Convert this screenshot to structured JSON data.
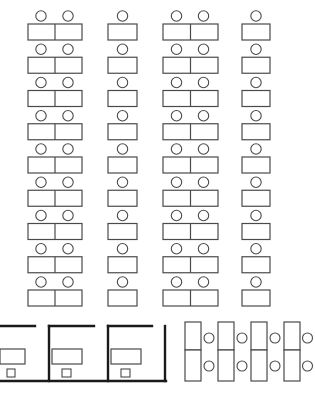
{
  "diagram": {
    "title": "",
    "type": "office-seating-layout",
    "colors": {
      "line": "#4a4a4a",
      "wall": "#1a1a1a",
      "background": "#ffffff"
    },
    "classroom_rows": {
      "row_count": 9,
      "first_desk_top": 24,
      "row_spacing": 33.25,
      "desk_height": 16,
      "seat_radius": 5.2,
      "seat_gap": 8,
      "columns": [
        {
          "name": "column-1",
          "x": 28,
          "width": 54,
          "seats": 2,
          "seat_centers": [
            41,
            68
          ]
        },
        {
          "name": "column-2",
          "x": 108,
          "width": 29,
          "seats": 1,
          "seat_centers": [
            122.5
          ]
        },
        {
          "name": "column-3",
          "x": 163,
          "width": 55,
          "seats": 2,
          "seat_centers": [
            176.5,
            203.5
          ]
        },
        {
          "name": "column-4",
          "x": 242,
          "width": 28,
          "seats": 1,
          "seat_centers": [
            256
          ]
        }
      ]
    },
    "cubicles": {
      "count": 3,
      "floor_y": 381,
      "top_y": 326,
      "units": [
        {
          "name": "cubicle-1",
          "left_wall_x": null,
          "top_wall": [
            0,
            35
          ],
          "desk": [
            0,
            349,
            25,
            15
          ],
          "chair": [
            7,
            369,
            8,
            8
          ]
        },
        {
          "name": "cubicle-2",
          "left_wall_x": 49,
          "top_wall": [
            49,
            94
          ],
          "desk": [
            52,
            349,
            30,
            15
          ],
          "chair": [
            62,
            369,
            9,
            8
          ]
        },
        {
          "name": "cubicle-3",
          "left_wall_x": 108,
          "top_wall": [
            108,
            152
          ],
          "desk": [
            111,
            349,
            30,
            15
          ],
          "chair": [
            121,
            369,
            9,
            8
          ]
        }
      ],
      "right_wall_x": 165,
      "floor_span": [
        0,
        166
      ]
    },
    "paired_desks": {
      "count": 4,
      "top_y": 322,
      "split_y": 350,
      "bottom_y": 381,
      "desk_width": 16,
      "seat_radius": 5,
      "seat_centers_y": [
        338,
        366
      ],
      "groups": [
        {
          "name": "pair-1",
          "x": 185,
          "seat_x": 209
        },
        {
          "name": "pair-2",
          "x": 218,
          "seat_x": 242
        },
        {
          "name": "pair-3",
          "x": 251,
          "seat_x": 275
        },
        {
          "name": "pair-4",
          "x": 284,
          "seat_x": 307.5
        }
      ]
    }
  }
}
